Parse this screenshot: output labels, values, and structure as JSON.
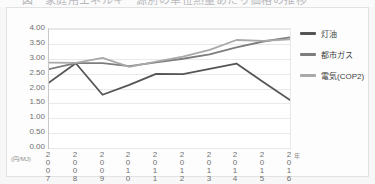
{
  "caption": {
    "text": "図　家庭用エネルギー源別の単位熱量あたり価格の推移"
  },
  "chart_data": {
    "type": "line",
    "title": "",
    "xlabel": "",
    "ylabel": "",
    "unit_label": "(円/MJ)",
    "x_end_marker": "年",
    "categories": [
      "2007",
      "2008",
      "2009",
      "2010",
      "2011",
      "2012",
      "2013",
      "2014",
      "2015",
      "2016"
    ],
    "ylim": [
      0.0,
      4.0
    ],
    "ytick_labels": [
      "4.00",
      "3.50",
      "3.00",
      "2.50",
      "2.00",
      "1.50",
      "1.00",
      "0.50",
      "0.00"
    ],
    "ytick_values": [
      4.0,
      3.5,
      3.0,
      2.5,
      2.0,
      1.5,
      1.0,
      0.5,
      0.0
    ],
    "grid": true,
    "legend_position": "right",
    "series": [
      {
        "name": "灯油",
        "color": "#555555",
        "values": [
          2.2,
          2.85,
          1.79,
          2.12,
          2.49,
          2.48,
          2.66,
          2.84,
          2.22,
          1.61
        ]
      },
      {
        "name": "都市ガス",
        "color": "#7d7d7d",
        "values": [
          2.65,
          2.85,
          2.85,
          2.75,
          2.88,
          3.0,
          3.15,
          3.38,
          3.58,
          3.72
        ]
      },
      {
        "name": "電気(COP2)",
        "color": "#a9a9a9",
        "values": [
          2.87,
          2.86,
          3.03,
          2.73,
          2.9,
          3.07,
          3.3,
          3.63,
          3.6,
          3.65
        ]
      }
    ]
  },
  "legend": {
    "items": [
      {
        "label": "灯油",
        "color": "#555555"
      },
      {
        "label": "都市ガス",
        "color": "#7d7d7d"
      },
      {
        "label": "電気(COP2)",
        "color": "#a9a9a9"
      }
    ]
  }
}
